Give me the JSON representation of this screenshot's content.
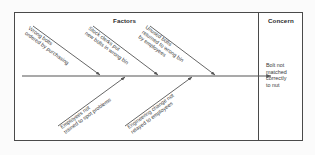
{
  "diagram": {
    "type": "fishbone-cause-and-effect",
    "headers": {
      "factors": "Factors",
      "concern": "Concern"
    },
    "concern": {
      "lines": [
        "Bolt not",
        "matched",
        "correctly",
        "to nut"
      ]
    },
    "branches_top": [
      {
        "id": "wrong-bolts-ordered",
        "lines": [
          "Wrong bolts",
          "ordered by purchasing"
        ]
      },
      {
        "id": "stock-clerks-wrong-bin",
        "lines": [
          "Stock clerks put",
          "new bolts in wrong bin"
        ]
      },
      {
        "id": "unused-bolts-returned",
        "lines": [
          "Unused bolts",
          "returned to wrong bin",
          "by employees"
        ]
      }
    ],
    "branches_bottom": [
      {
        "id": "employees-not-trained",
        "lines": [
          "Employees not",
          "trained to spot problems"
        ]
      },
      {
        "id": "engineering-change-not-relayed",
        "lines": [
          "Engineering change not",
          "relayed to employees"
        ]
      }
    ],
    "colors": {
      "line": "#555555",
      "border": "#4a4a4a",
      "text": "#3a3a3a",
      "background": "#ffffff"
    }
  }
}
